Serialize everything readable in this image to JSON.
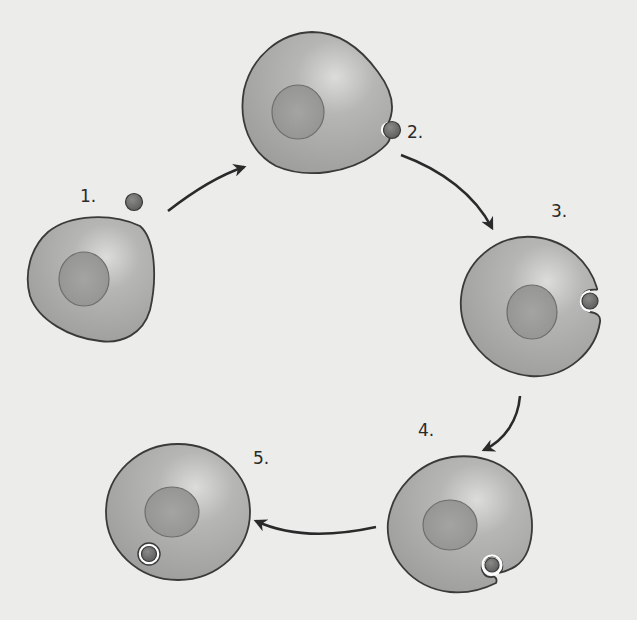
{
  "diagram": {
    "type": "process-cycle",
    "steps": [
      {
        "label": "1.",
        "description": "Cell with free particle nearby"
      },
      {
        "label": "2.",
        "description": "Particle contacts membrane, small indentation"
      },
      {
        "label": "3.",
        "description": "Membrane invaginates around particle"
      },
      {
        "label": "4.",
        "description": "Membrane nearly encloses particle"
      },
      {
        "label": "5.",
        "description": "Particle enclosed in vesicle inside cell"
      }
    ],
    "arrows": [
      {
        "from": "1",
        "to": "2"
      },
      {
        "from": "2",
        "to": "3"
      },
      {
        "from": "3",
        "to": "4"
      },
      {
        "from": "4",
        "to": "5"
      }
    ],
    "colors": {
      "background": "#ececea",
      "cytoplasm": "#a9a9a7",
      "cytoplasm_highlight": "#d6d6d4",
      "nucleus": "#979795",
      "outline": "#3a3a3a",
      "particle": "#6e6e6c",
      "arrow": "#2a2a2a"
    }
  }
}
